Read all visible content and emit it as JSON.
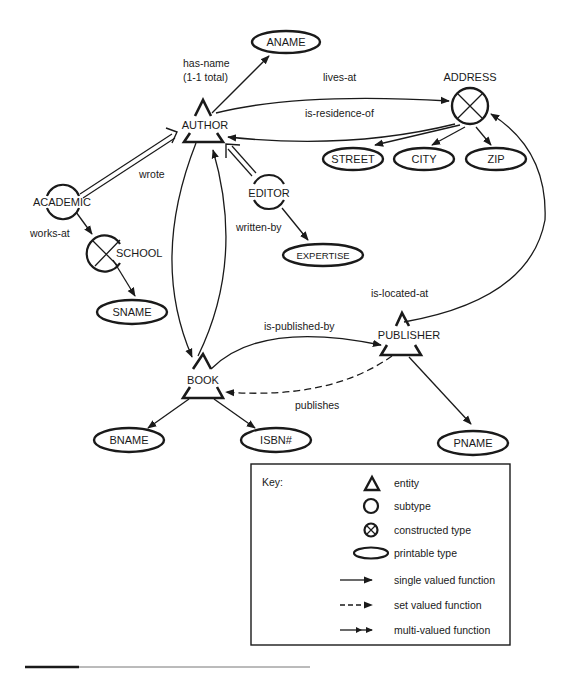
{
  "nodes": {
    "aname": {
      "label": "ANAME",
      "kind": "printable-type"
    },
    "author": {
      "label": "AUTHOR",
      "kind": "entity"
    },
    "address": {
      "label": "ADDRESS",
      "kind": "constructed-type"
    },
    "street": {
      "label": "STREET",
      "kind": "printable-type"
    },
    "city": {
      "label": "CITY",
      "kind": "printable-type"
    },
    "zip": {
      "label": "ZIP",
      "kind": "printable-type"
    },
    "academic": {
      "label": "ACADEMIC",
      "kind": "subtype"
    },
    "editor": {
      "label": "EDITOR",
      "kind": "subtype"
    },
    "school": {
      "label": "SCHOOL",
      "kind": "constructed-type"
    },
    "sname": {
      "label": "SNAME",
      "kind": "printable-type"
    },
    "expertise": {
      "label": "EXPERTISE",
      "kind": "printable-type"
    },
    "publisher": {
      "label": "PUBLISHER",
      "kind": "entity"
    },
    "book": {
      "label": "BOOK",
      "kind": "entity"
    },
    "bname": {
      "label": "BNAME",
      "kind": "printable-type"
    },
    "isbn": {
      "label": "ISBN#",
      "kind": "printable-type"
    },
    "pname": {
      "label": "PNAME",
      "kind": "printable-type"
    }
  },
  "edges": {
    "has_name": {
      "label_line1": "has-name",
      "label_line2": "(1-1 total)",
      "from": "AUTHOR",
      "to": "ANAME",
      "type": "single"
    },
    "lives_at": {
      "label": "lives-at",
      "from": "AUTHOR",
      "to": "ADDRESS",
      "type": "single"
    },
    "is_residence_of": {
      "label": "is-residence-of",
      "from": "ADDRESS",
      "to": "AUTHOR",
      "type": "single"
    },
    "wrote": {
      "label": "wrote",
      "from": "AUTHOR",
      "to": "BOOK",
      "type": "single"
    },
    "written_by": {
      "label": "written-by",
      "from": "BOOK",
      "to": "AUTHOR",
      "type": "single"
    },
    "works_at": {
      "label": "works-at",
      "from": "ACADEMIC",
      "to": "SCHOOL",
      "type": "single"
    },
    "is_published_by": {
      "label": "is-published-by",
      "from": "BOOK",
      "to": "PUBLISHER",
      "type": "single"
    },
    "publishes": {
      "label": "publishes",
      "from": "PUBLISHER",
      "to": "BOOK",
      "type": "set"
    },
    "is_located_at": {
      "label": "is-located-at",
      "from": "PUBLISHER",
      "to": "ADDRESS",
      "type": "single"
    }
  },
  "key": {
    "title": "Key:",
    "items": [
      {
        "symbol": "triangle",
        "label": "entity"
      },
      {
        "symbol": "circle",
        "label": "subtype"
      },
      {
        "symbol": "crossed-circle",
        "label": "constructed type"
      },
      {
        "symbol": "ellipse",
        "label": "printable type"
      },
      {
        "symbol": "solid-arrow",
        "label": "single valued function"
      },
      {
        "symbol": "dashed-arrow",
        "label": "set valued function"
      },
      {
        "symbol": "double-head-arrow",
        "label": "multi-valued function"
      }
    ]
  },
  "colors": {
    "ink": "#1a1a1a",
    "background": "#ffffff"
  }
}
